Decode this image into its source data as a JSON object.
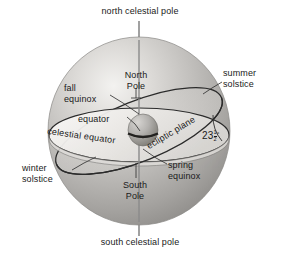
{
  "figure": {
    "type": "astronomy-diagram"
  },
  "labels": {
    "north_celestial_pole": "north celestial pole",
    "south_celestial_pole": "south celestial pole",
    "north_pole_line1": "North",
    "north_pole_line2": "Pole",
    "south_pole_line1": "South",
    "south_pole_line2": "Pole",
    "fall_equinox_line1": "fall",
    "fall_equinox_line2": "equinox",
    "spring_equinox_line1": "spring",
    "spring_equinox_line2": "equinox",
    "summer_solstice_line1": "summer",
    "summer_solstice_line2": "solstice",
    "winter_solstice_line1": "winter",
    "winter_solstice_line2": "solstice",
    "equator": "equator",
    "celestial_equator": "celestial equator",
    "ecliptic_plane": "ecliptic plane",
    "tilt_whole": "23",
    "tilt_numerator": "1",
    "tilt_denominator": "2",
    "tilt_degree": "°"
  },
  "colors": {
    "sphere_light": "#f0efed",
    "sphere_mid": "#b9b7b4",
    "sphere_dark": "#8f8d8a",
    "sphere_edge": "#6f6d6a",
    "plane_fill": "#f4f3f1",
    "line": "#2b2b2b",
    "text": "#1a1a1a",
    "pole_axis": "#8a8a8a",
    "earth_dark": "#4a4947"
  }
}
